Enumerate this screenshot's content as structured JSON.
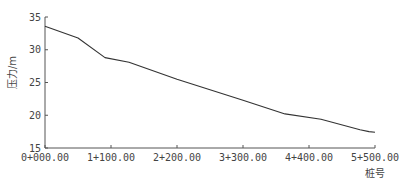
{
  "chart_data": {
    "type": "line",
    "title": "",
    "xlabel": "桩号",
    "ylabel": "压力/m",
    "xlim": [
      0,
      5500
    ],
    "ylim": [
      15,
      35
    ],
    "grid": false,
    "legend": null,
    "x_ticks": [
      {
        "value": 0,
        "label": "0+000.00"
      },
      {
        "value": 1100,
        "label": "1+100.00"
      },
      {
        "value": 2200,
        "label": "2+200.00"
      },
      {
        "value": 3300,
        "label": "3+300.00"
      },
      {
        "value": 4400,
        "label": "4+400.00"
      },
      {
        "value": 5500,
        "label": "5+500.00"
      }
    ],
    "y_ticks": [
      {
        "value": 15,
        "label": "15"
      },
      {
        "value": 20,
        "label": "20"
      },
      {
        "value": 25,
        "label": "25"
      },
      {
        "value": 30,
        "label": "30"
      },
      {
        "value": 35,
        "label": "35"
      }
    ],
    "series": [
      {
        "name": "压力",
        "color": "#333333",
        "x": [
          0,
          550,
          1000,
          1400,
          2200,
          3300,
          4000,
          4600,
          5250,
          5400,
          5500
        ],
        "values": [
          33.6,
          31.8,
          28.8,
          28.1,
          25.5,
          22.3,
          20.2,
          19.4,
          17.8,
          17.5,
          17.4
        ]
      }
    ]
  }
}
